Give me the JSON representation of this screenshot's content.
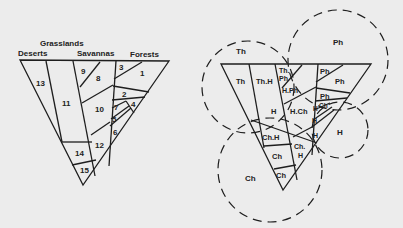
{
  "left_diagram": {
    "headers": {
      "deserts": "Deserts",
      "grasslands": "Grasslands",
      "savannas": "Savannas",
      "forests": "Forests"
    },
    "regions": [
      "1",
      "2",
      "3",
      "4",
      "5",
      "6",
      "7",
      "8",
      "9",
      "10",
      "11",
      "12",
      "13",
      "14",
      "15"
    ]
  },
  "right_diagram": {
    "circles": {
      "th": "Th",
      "ph": "Ph",
      "h": "H",
      "ch": "Ch"
    },
    "regions": {
      "r13": "Th",
      "r11": "Th.H",
      "r9a": "Th.",
      "r9b": "Ph",
      "r8": "H.Ph",
      "r3": "Ph",
      "r1": "Ph",
      "r2": "Ph",
      "r10_left": "H",
      "r10": "H.Ch",
      "r7a": "H",
      "r7b": "Ch",
      "r5": "H",
      "r6": "H",
      "r4": "H",
      "r14_top": "Ch.H",
      "r12a": "Ch.",
      "r12b": "H",
      "r14": "Ch",
      "r15": "Ch"
    }
  }
}
